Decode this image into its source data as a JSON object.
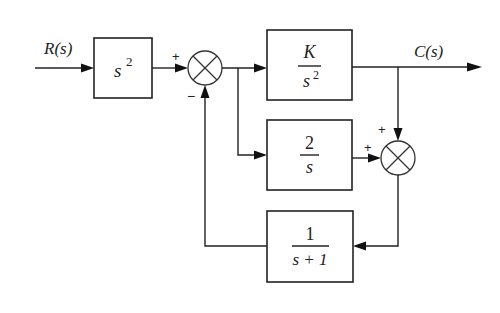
{
  "diagram": {
    "type": "control-system block diagram",
    "input_label": "R(s)",
    "output_label": "C(s)",
    "blocks": [
      {
        "id": "prefilter",
        "tf": "s^2",
        "numerator": "s",
        "superscript": "2"
      },
      {
        "id": "forward",
        "tf": "K/s^2",
        "numerator": "K",
        "denominator": "s",
        "denominator_superscript": "2"
      },
      {
        "id": "parallel",
        "tf": "2/s",
        "numerator": "2",
        "denominator": "s"
      },
      {
        "id": "feedback",
        "tf": "1/(s+1)",
        "numerator": "1",
        "denominator": "s + 1"
      }
    ],
    "summing_junctions": [
      {
        "id": "sum1",
        "signs": {
          "left": "+",
          "bottom": "−"
        }
      },
      {
        "id": "sum2",
        "signs": {
          "top": "+",
          "left": "+"
        }
      }
    ],
    "colors": {
      "line": "#222222",
      "background": "#ffffff"
    }
  }
}
